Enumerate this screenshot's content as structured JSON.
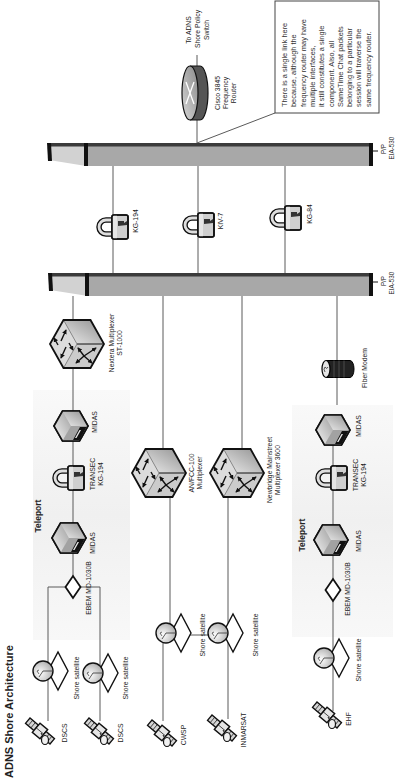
{
  "title": "ADNS Shore Architecture",
  "colors": {
    "line": "#5a5a5a",
    "bar": "#a8a8a8",
    "bar_edge": "#3b3b3b",
    "bar_face": "#d2d2d2",
    "group_fill": "#f2f2f2",
    "text": "#222222"
  },
  "satellites": [
    {
      "label": "DSCS",
      "icon": "satellite-icon"
    },
    {
      "label": "DSCS",
      "icon": "satellite-icon"
    },
    {
      "label": "CWSP",
      "icon": "satellite-icon"
    },
    {
      "label": "INMARSAT",
      "icon": "satellite-icon"
    },
    {
      "label": "EHF",
      "icon": "satellite-icon"
    }
  ],
  "shore_satellites": [
    {
      "label": "Shore satellite",
      "icon": "satellite-dish-icon"
    },
    {
      "label": "Shore satellite",
      "icon": "satellite-dish-icon"
    },
    {
      "label": "Shore satellite",
      "icon": "satellite-dish-icon"
    },
    {
      "label": "Shore satellite",
      "icon": "satellite-dish-icon"
    },
    {
      "label": "Shore satellite",
      "icon": "satellite-dish-icon"
    }
  ],
  "teleports": [
    {
      "label": "Teleport",
      "modem": "EBEM MD-1030B",
      "midas": [
        "MIDAS",
        "MIDAS"
      ],
      "transec": [
        "TRANSEC",
        "KG-194"
      ]
    },
    {
      "label": "Teleport",
      "modem": "EBEM MD-1030B",
      "midas": [
        "MIDAS",
        "MIDAS"
      ],
      "transec": [
        "TRANSEC",
        "KG-194"
      ]
    }
  ],
  "multiplexers": {
    "nextera": [
      "Nextera Multiplexer",
      "ST-1000"
    ],
    "anfcc": [
      "AN/FCC-100",
      "Multiplexer"
    ],
    "newbridge": [
      "Newbridge Mainstreet",
      "Multiplexer 3600"
    ]
  },
  "fiber_modem": {
    "label": "Fiber Modem",
    "icon": "fiber-modem-icon"
  },
  "patch_panels": [
    {
      "lines": [
        "P/P",
        "EIA-530"
      ]
    },
    {
      "lines": [
        "P/P",
        "EIA-530"
      ]
    }
  ],
  "crypto_devices": [
    {
      "label": "KG-194",
      "icon": "lock-icon"
    },
    {
      "label": "KIV-7",
      "icon": "lock-icon"
    },
    {
      "label": "KG-84",
      "icon": "lock-icon"
    }
  ],
  "router": {
    "lines": [
      "Cisco 3845",
      "Frequency",
      "Router"
    ],
    "icon": "router-icon"
  },
  "uplink": {
    "lines": [
      "To ADNS",
      "Shore Policy",
      "Switch"
    ]
  },
  "callout": {
    "lines": [
      "There is a single link here",
      "because, although the",
      "frequency router may have",
      "multiple interfaces,",
      "it still constitutes a single",
      "component. Also, all",
      "SameTime Chat packets",
      "belonging to a particular",
      "session will traverse the",
      "same frequency router."
    ]
  }
}
